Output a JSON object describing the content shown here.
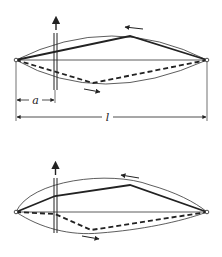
{
  "figure": {
    "colors": {
      "ink": "#222222",
      "background": "#ffffff"
    },
    "top_diagram": {
      "labels": {
        "a": "a",
        "l": "l"
      },
      "force_arrow": "upward-arrow",
      "motion_arrows": [
        "left-arrow",
        "right-arrow"
      ]
    },
    "bottom_diagram": {
      "force_arrow": "upward-arrow",
      "motion_arrows": [
        "left-arrow",
        "right-arrow"
      ]
    }
  }
}
